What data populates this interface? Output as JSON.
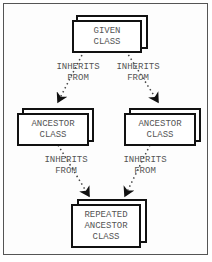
{
  "diagram": {
    "nodes": {
      "given": {
        "lines": [
          "GIVEN",
          "CLASS"
        ]
      },
      "ancestor_left": {
        "lines": [
          "ANCESTOR",
          "CLASS"
        ]
      },
      "ancestor_right": {
        "lines": [
          "ANCESTOR",
          "CLASS"
        ]
      },
      "repeated": {
        "lines": [
          "REPEATED",
          "ANCESTOR",
          "CLASS"
        ]
      }
    },
    "edges": [
      {
        "from": "given",
        "to": "ancestor_left",
        "lines": [
          "INHERITS",
          "FROM"
        ]
      },
      {
        "from": "given",
        "to": "ancestor_right",
        "lines": [
          "INHERITS",
          "FROM"
        ]
      },
      {
        "from": "ancestor_left",
        "to": "repeated",
        "lines": [
          "INHERITS",
          "FROM"
        ]
      },
      {
        "from": "ancestor_right",
        "to": "repeated",
        "lines": [
          "INHERITS",
          "FROM"
        ]
      }
    ]
  }
}
